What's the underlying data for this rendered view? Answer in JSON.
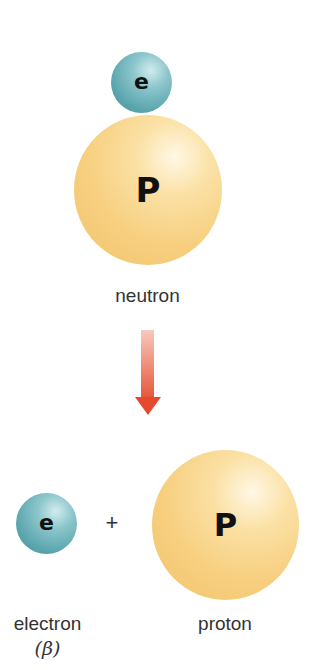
{
  "diagram": {
    "type": "beta-decay",
    "top": {
      "electron_symbol": "e",
      "proton_symbol": "P",
      "label": "neutron"
    },
    "arrow": {
      "direction": "down",
      "color": "#e6492f"
    },
    "bottom": {
      "electron_symbol": "e",
      "plus": "+",
      "proton_symbol": "P",
      "electron_label": "electron",
      "electron_sublabel": "(β)",
      "proton_label": "proton"
    },
    "colors": {
      "electron": "#5aa5ad",
      "proton": "#f7cf7f",
      "arrow": "#e6492f"
    }
  }
}
